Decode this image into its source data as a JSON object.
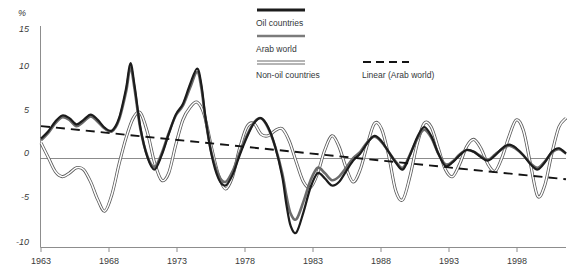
{
  "chart_data": {
    "type": "line",
    "title": "",
    "xlabel": "",
    "ylabel": "%",
    "ylim": [
      -10,
      15
    ],
    "xlim": [
      1963,
      2000
    ],
    "grid": false,
    "zero_line": true,
    "legend_position": "top-center",
    "y_ticks": [
      "15",
      "10",
      "5",
      "0",
      "-5",
      "-10"
    ],
    "y_tick_values": [
      15,
      10,
      5,
      0,
      -5,
      -10
    ],
    "x_ticks": [
      "1963",
      "1968",
      "1973",
      "1978",
      "1983",
      "1988",
      "1993",
      "1998"
    ],
    "x_tick_values": [
      1963,
      1968,
      1973,
      1978,
      1983,
      1988,
      1993,
      1998
    ],
    "series": [
      {
        "name": "Oil countries",
        "style": "thick-solid-black",
        "color": "#1c1c1c",
        "x": [
          1963,
          1963.5,
          1964,
          1964.5,
          1965,
          1965.5,
          1966,
          1966.5,
          1967,
          1967.5,
          1968,
          1968.5,
          1969,
          1969.3,
          1969.6,
          1970,
          1970.5,
          1971,
          1971.5,
          1972,
          1972.5,
          1973,
          1973.5,
          1974,
          1974.3,
          1974.6,
          1975,
          1975.5,
          1976,
          1976.5,
          1977,
          1977.5,
          1978,
          1978.5,
          1979,
          1979.5,
          1980,
          1980.3,
          1980.6,
          1981,
          1981.5,
          1982,
          1982.5,
          1983,
          1983.5,
          1984,
          1984.5,
          1985,
          1985.5,
          1986,
          1986.5,
          1987,
          1987.5,
          1988,
          1988.5,
          1989,
          1989.5,
          1990,
          1990.5,
          1991,
          1991.5,
          1992,
          1992.5,
          1993,
          1993.5,
          1994,
          1994.5,
          1995,
          1995.5,
          1996,
          1996.5,
          1997,
          1997.5,
          1998,
          1998.5,
          1999,
          1999.5,
          2000
        ],
        "y": [
          2.3,
          3.1,
          4.2,
          4.9,
          4.6,
          3.9,
          4.4,
          5.0,
          4.4,
          3.5,
          3.2,
          4.6,
          8.0,
          10.8,
          8.2,
          3.6,
          0.2,
          -1.2,
          0.4,
          2.8,
          5.0,
          6.2,
          8.4,
          10.2,
          8.4,
          4.6,
          0.6,
          -2.2,
          -3.0,
          -1.8,
          0.4,
          2.4,
          4.0,
          4.6,
          3.6,
          1.4,
          -2.0,
          -5.2,
          -7.6,
          -8.3,
          -6.0,
          -3.2,
          -1.6,
          -2.2,
          -3.0,
          -2.6,
          -1.4,
          -0.2,
          0.6,
          1.8,
          2.6,
          2.0,
          0.8,
          -0.4,
          -1.2,
          0.4,
          2.4,
          3.6,
          2.6,
          0.6,
          -0.8,
          -0.4,
          0.4,
          1.0,
          0.8,
          0.2,
          -0.2,
          0.4,
          1.2,
          1.6,
          1.2,
          0.4,
          -0.6,
          -1.2,
          -0.4,
          0.8,
          1.2,
          0.6
        ]
      },
      {
        "name": "Arab world",
        "style": "medium-solid-gray",
        "color": "#6b6b6b",
        "x": [
          1963,
          1963.5,
          1964,
          1964.5,
          1965,
          1965.5,
          1966,
          1966.5,
          1967,
          1967.5,
          1968,
          1968.5,
          1969,
          1969.3,
          1969.6,
          1970,
          1970.5,
          1971,
          1971.5,
          1972,
          1972.5,
          1973,
          1973.5,
          1974,
          1974.3,
          1974.6,
          1975,
          1975.5,
          1976,
          1976.5,
          1977,
          1977.5,
          1978,
          1978.5,
          1979,
          1979.5,
          1980,
          1980.3,
          1980.6,
          1981,
          1981.5,
          1982,
          1982.5,
          1983,
          1983.5,
          1984,
          1984.5,
          1985,
          1985.5,
          1986,
          1986.5,
          1987,
          1987.5,
          1988,
          1988.5,
          1989,
          1989.5,
          1990,
          1990.5,
          1991,
          1991.5,
          1992,
          1992.5,
          1993,
          1993.5,
          1994,
          1994.5,
          1995,
          1995.5,
          1996,
          1996.5,
          1997,
          1997.5,
          1998,
          1998.5,
          1999,
          1999.5,
          2000
        ],
        "y": [
          2.1,
          2.9,
          4.0,
          4.7,
          4.4,
          3.7,
          4.2,
          4.8,
          4.2,
          3.4,
          3.1,
          4.4,
          7.6,
          10.3,
          7.8,
          3.4,
          0.3,
          -0.9,
          0.6,
          2.9,
          4.9,
          6.0,
          8.0,
          9.8,
          8.0,
          4.4,
          0.8,
          -1.8,
          -2.6,
          -1.4,
          0.7,
          2.6,
          4.1,
          4.6,
          3.5,
          1.4,
          -1.6,
          -4.2,
          -6.2,
          -6.8,
          -4.8,
          -2.4,
          -1.0,
          -1.6,
          -2.4,
          -2.0,
          -1.0,
          0.1,
          0.8,
          1.9,
          2.5,
          1.9,
          0.8,
          -0.3,
          -1.0,
          0.5,
          2.2,
          3.3,
          2.4,
          0.6,
          -0.6,
          -0.3,
          0.5,
          1.0,
          0.8,
          0.3,
          -0.1,
          0.5,
          1.1,
          1.5,
          1.1,
          0.4,
          -0.5,
          -1.0,
          -0.3,
          0.7,
          1.1,
          0.6
        ]
      },
      {
        "name": "Non-oil countries",
        "style": "thin-outline-double",
        "color": "#5a5a5a",
        "x": [
          1963,
          1963.5,
          1964,
          1964.5,
          1965,
          1965.5,
          1966,
          1966.5,
          1967,
          1967.5,
          1968,
          1968.5,
          1969,
          1969.5,
          1970,
          1970.5,
          1971,
          1971.5,
          1972,
          1972.5,
          1973,
          1973.5,
          1974,
          1974.5,
          1975,
          1975.5,
          1976,
          1976.5,
          1977,
          1977.5,
          1978,
          1978.5,
          1979,
          1979.5,
          1980,
          1980.5,
          1981,
          1981.5,
          1982,
          1982.5,
          1983,
          1983.5,
          1984,
          1984.5,
          1985,
          1985.5,
          1986,
          1986.5,
          1987,
          1987.5,
          1988,
          1988.5,
          1989,
          1989.5,
          1990,
          1990.5,
          1991,
          1991.5,
          1992,
          1992.5,
          1993,
          1993.5,
          1994,
          1994.5,
          1995,
          1995.5,
          1996,
          1996.5,
          1997,
          1997.5,
          1998,
          1998.5,
          1999,
          1999.5,
          2000
        ],
        "y": [
          1.8,
          0.2,
          -1.4,
          -2.0,
          -1.6,
          -1.0,
          -1.2,
          -2.6,
          -4.6,
          -5.9,
          -4.0,
          -0.6,
          2.4,
          4.6,
          5.2,
          3.0,
          -0.4,
          -2.4,
          -1.6,
          1.6,
          4.4,
          5.8,
          6.4,
          5.0,
          1.4,
          -1.8,
          -3.4,
          -2.0,
          1.2,
          3.6,
          4.0,
          2.8,
          2.6,
          3.2,
          3.4,
          2.0,
          -0.4,
          -2.6,
          -3.2,
          -1.6,
          1.0,
          2.6,
          1.4,
          -1.0,
          -2.6,
          -1.2,
          1.6,
          4.0,
          3.4,
          0.4,
          -3.6,
          -4.6,
          -2.0,
          1.6,
          4.0,
          3.6,
          1.2,
          -1.2,
          -2.0,
          -0.6,
          1.4,
          2.2,
          1.2,
          -0.6,
          -1.4,
          0.2,
          2.6,
          4.4,
          3.2,
          -0.6,
          -4.2,
          -3.0,
          0.6,
          3.6,
          4.6
        ]
      }
    ],
    "trendline": {
      "name": "Linear (Arab world)",
      "style": "dashed-black",
      "color": "#141414",
      "x_start": 1963,
      "x_end": 2000,
      "y_start": 3.7,
      "y_end": -2.3
    }
  },
  "legend": {
    "items": [
      {
        "label": "Oil countries",
        "swatch": "thick-solid-black"
      },
      {
        "label": "Arab world",
        "swatch": "medium-solid-gray"
      },
      {
        "label": "Non-oil countries",
        "swatch": "thin-outline-double"
      },
      {
        "label": "Linear (Arab world)",
        "swatch": "dashed-black"
      }
    ]
  },
  "axis": {
    "y_unit": "%",
    "y_labels": [
      "15",
      "10",
      "5",
      "0",
      "-5",
      "-10"
    ],
    "x_labels": [
      "1963",
      "1968",
      "1973",
      "1978",
      "1983",
      "1988",
      "1993",
      "1998"
    ]
  }
}
